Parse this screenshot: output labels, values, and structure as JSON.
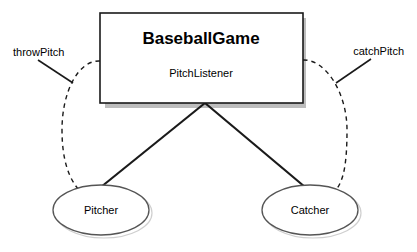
{
  "diagram": {
    "type": "uml-observer-pattern",
    "background_color": "#ffffff",
    "stroke_color": "#1a1a1a",
    "shadow_color": "#bdbdbd",
    "subject": {
      "shape": "rectangle",
      "title": "BaseballGame",
      "subtitle": "PitchListener",
      "fill": "#ffffff",
      "border_color": "#1a1a1a",
      "has_drop_shadow": true
    },
    "observers": [
      {
        "id": "pitcher",
        "shape": "ellipse",
        "label": "Pitcher",
        "fill": "#ffffff",
        "border_color": "#555555"
      },
      {
        "id": "catcher",
        "shape": "ellipse",
        "label": "Catcher",
        "fill": "#ffffff",
        "border_color": "#555555"
      }
    ],
    "edges": [
      {
        "id": "throw-pitch",
        "label": "throwPitch",
        "style": "dashed",
        "from": "subject",
        "to": "pitcher",
        "side": "left"
      },
      {
        "id": "catch-pitch",
        "label": "catchPitch",
        "style": "dashed",
        "from": "subject",
        "to": "catcher",
        "side": "right"
      },
      {
        "id": "subject-to-pitcher",
        "label": "",
        "style": "solid",
        "from": "subject",
        "to": "pitcher",
        "side": "center"
      },
      {
        "id": "subject-to-catcher",
        "label": "",
        "style": "solid",
        "from": "subject",
        "to": "catcher",
        "side": "center"
      }
    ]
  }
}
